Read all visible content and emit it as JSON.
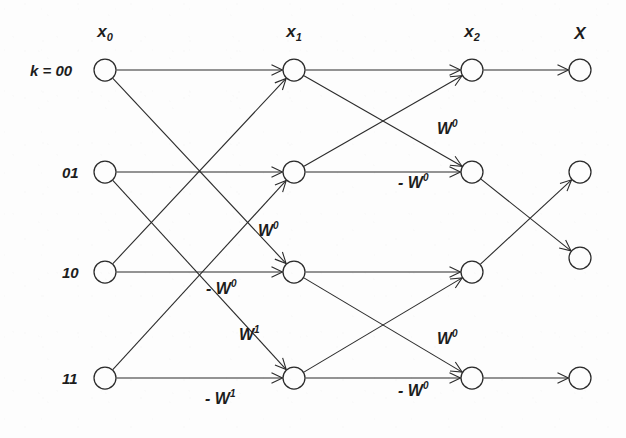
{
  "figure": {
    "title": "",
    "type": "signal-flow-graph",
    "background_color": "#fdfdfd",
    "ink_color": "#2b2b2b"
  },
  "column_headers": [
    {
      "id": "x0",
      "base": "x",
      "sub": "0",
      "x": 105,
      "y": 33
    },
    {
      "id": "x1",
      "base": "x",
      "sub": "1",
      "x": 294,
      "y": 33
    },
    {
      "id": "x2",
      "base": "x",
      "sub": "2",
      "x": 472,
      "y": 33
    },
    {
      "id": "X",
      "base": "X",
      "sub": "",
      "x": 580,
      "y": 33
    }
  ],
  "row_labels": [
    {
      "id": "row-00",
      "text": "k = 00",
      "x": 30,
      "y": 70
    },
    {
      "id": "row-01",
      "text": "01",
      "x": 62,
      "y": 172
    },
    {
      "id": "row-10",
      "text": "10",
      "x": 62,
      "y": 272
    },
    {
      "id": "row-11",
      "text": "11",
      "x": 62,
      "y": 378
    }
  ],
  "columns": [
    {
      "id": "x0",
      "nodes": [
        {
          "id": "x0-0",
          "cx": 105,
          "cy": 70,
          "r": 11
        },
        {
          "id": "x0-1",
          "cx": 105,
          "cy": 172,
          "r": 11
        },
        {
          "id": "x0-2",
          "cx": 105,
          "cy": 272,
          "r": 11
        },
        {
          "id": "x0-3",
          "cx": 105,
          "cy": 378,
          "r": 11
        }
      ]
    },
    {
      "id": "x1",
      "nodes": [
        {
          "id": "x1-0",
          "cx": 294,
          "cy": 70,
          "r": 11
        },
        {
          "id": "x1-1",
          "cx": 294,
          "cy": 172,
          "r": 11
        },
        {
          "id": "x1-2",
          "cx": 294,
          "cy": 272,
          "r": 11
        },
        {
          "id": "x1-3",
          "cx": 294,
          "cy": 378,
          "r": 11
        }
      ]
    },
    {
      "id": "x2",
      "nodes": [
        {
          "id": "x2-0",
          "cx": 472,
          "cy": 70,
          "r": 11
        },
        {
          "id": "x2-1",
          "cx": 472,
          "cy": 172,
          "r": 11
        },
        {
          "id": "x2-2",
          "cx": 472,
          "cy": 272,
          "r": 11
        },
        {
          "id": "x2-3",
          "cx": 472,
          "cy": 378,
          "r": 11
        }
      ]
    },
    {
      "id": "X",
      "nodes": [
        {
          "id": "X-0",
          "cx": 580,
          "cy": 70,
          "r": 11
        },
        {
          "id": "X-1",
          "cx": 580,
          "cy": 172,
          "r": 11
        },
        {
          "id": "X-2",
          "cx": 580,
          "cy": 258,
          "r": 11
        },
        {
          "id": "X-3",
          "cx": 580,
          "cy": 378,
          "r": 11
        }
      ]
    }
  ],
  "edges": [
    {
      "id": "e-s1-00",
      "from": "x0-0",
      "to": "x1-0",
      "weight": ""
    },
    {
      "id": "e-s1-02",
      "from": "x0-0",
      "to": "x1-2",
      "weight": ""
    },
    {
      "id": "e-s1-11",
      "from": "x0-1",
      "to": "x1-1",
      "weight": ""
    },
    {
      "id": "e-s1-13",
      "from": "x0-1",
      "to": "x1-3",
      "weight": ""
    },
    {
      "id": "e-s1-20",
      "from": "x0-2",
      "to": "x1-0",
      "weight": ""
    },
    {
      "id": "e-s1-22",
      "from": "x0-2",
      "to": "x1-2",
      "weight": "-W0"
    },
    {
      "id": "e-s1-31",
      "from": "x0-3",
      "to": "x1-1",
      "weight": "W0"
    },
    {
      "id": "e-s1-33",
      "from": "x0-3",
      "to": "x1-3",
      "weight": "-W1"
    },
    {
      "id": "e-s2-00",
      "from": "x1-0",
      "to": "x2-0",
      "weight": ""
    },
    {
      "id": "e-s2-01",
      "from": "x1-0",
      "to": "x2-1",
      "weight": "W0"
    },
    {
      "id": "e-s2-10",
      "from": "x1-1",
      "to": "x2-0",
      "weight": ""
    },
    {
      "id": "e-s2-11",
      "from": "x1-1",
      "to": "x2-1",
      "weight": "-W0"
    },
    {
      "id": "e-s2-22",
      "from": "x1-2",
      "to": "x2-2",
      "weight": ""
    },
    {
      "id": "e-s2-23",
      "from": "x1-2",
      "to": "x2-3",
      "weight": "W0"
    },
    {
      "id": "e-s2-32",
      "from": "x1-3",
      "to": "x2-2",
      "weight": ""
    },
    {
      "id": "e-s2-33",
      "from": "x1-3",
      "to": "x2-3",
      "weight": "-W0"
    },
    {
      "id": "e-s3-00",
      "from": "x2-0",
      "to": "X-0",
      "weight": ""
    },
    {
      "id": "e-s3-12",
      "from": "x2-1",
      "to": "X-2",
      "weight": ""
    },
    {
      "id": "e-s3-21",
      "from": "x2-2",
      "to": "X-1",
      "weight": ""
    },
    {
      "id": "e-s3-33",
      "from": "x2-3",
      "to": "X-3",
      "weight": ""
    }
  ],
  "weight_labels": [
    {
      "id": "w-mid-1",
      "base": "W",
      "sup": "0",
      "x": 258,
      "y": 230
    },
    {
      "id": "w-mid-2",
      "base": "- W",
      "sup": "0",
      "x": 206,
      "y": 288
    },
    {
      "id": "w-mid-3",
      "base": "W",
      "sup": "1",
      "x": 239,
      "y": 334
    },
    {
      "id": "w-mid-4",
      "base": "- W",
      "sup": "1",
      "x": 205,
      "y": 398
    },
    {
      "id": "w-top-1",
      "base": "W",
      "sup": "0",
      "x": 437,
      "y": 128
    },
    {
      "id": "w-top-2",
      "base": "- W",
      "sup": "0",
      "x": 398,
      "y": 182
    },
    {
      "id": "w-bot-1",
      "base": "W",
      "sup": "0",
      "x": 437,
      "y": 338
    },
    {
      "id": "w-bot-2",
      "base": "- W",
      "sup": "0",
      "x": 398,
      "y": 390
    }
  ]
}
